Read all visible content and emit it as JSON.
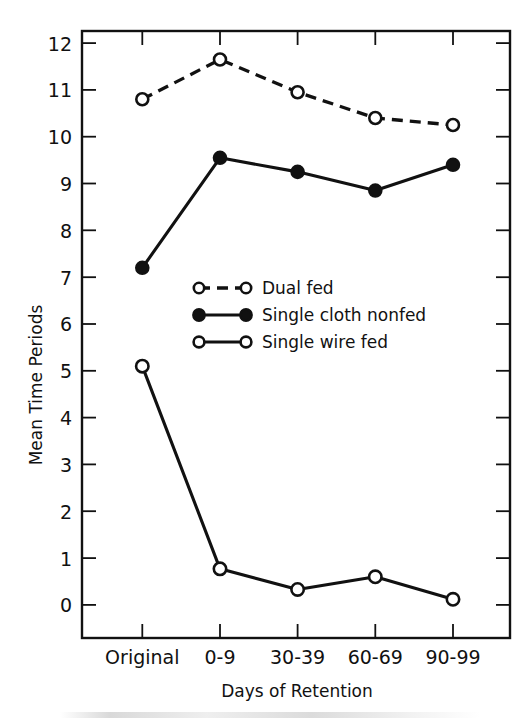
{
  "chart_data": {
    "type": "line",
    "title": "",
    "xlabel": "Days of Retention",
    "ylabel": "Mean Time Periods",
    "categories": [
      "Original",
      "0-9",
      "30-39",
      "60-69",
      "90-99"
    ],
    "ylim": [
      0,
      12
    ],
    "ytick_labels": [
      "0",
      "1",
      "2",
      "3",
      "4",
      "5",
      "6",
      "7",
      "8",
      "9",
      "10",
      "11",
      "12"
    ],
    "ytick_values": [
      0,
      1,
      2,
      3,
      4,
      5,
      6,
      7,
      8,
      9,
      10,
      11,
      12
    ],
    "grid": false,
    "legend_position": "center-left-inside",
    "series": [
      {
        "name": "Dual fed",
        "values": [
          10.8,
          11.65,
          10.95,
          10.4,
          10.25
        ],
        "line_style": "dashed",
        "marker": "open-circle"
      },
      {
        "name": "Single cloth nonfed",
        "values": [
          7.2,
          9.55,
          9.25,
          8.85,
          9.4
        ],
        "line_style": "solid",
        "marker": "filled-circle"
      },
      {
        "name": "Single wire fed",
        "values": [
          5.1,
          0.77,
          0.33,
          0.6,
          0.12
        ],
        "line_style": "solid",
        "marker": "open-circle"
      }
    ]
  },
  "axes": {
    "y_title": "Mean Time Periods",
    "x_title": "Days of Retention",
    "y_ticks": [
      "12",
      "11",
      "10",
      "9",
      "8",
      "7",
      "6",
      "5",
      "4",
      "3",
      "2",
      "1",
      "0"
    ],
    "x_ticks": [
      "Original",
      "0-9",
      "30-39",
      "60-69",
      "90-99"
    ]
  },
  "legend": {
    "entries": [
      {
        "label": "Dual fed"
      },
      {
        "label": "Single cloth nonfed"
      },
      {
        "label": "Single wire fed"
      }
    ]
  },
  "colors": {
    "ink": "#111111",
    "background": "#ffffff",
    "marker_fill_open": "#ffffff",
    "marker_fill_solid": "#111111"
  }
}
